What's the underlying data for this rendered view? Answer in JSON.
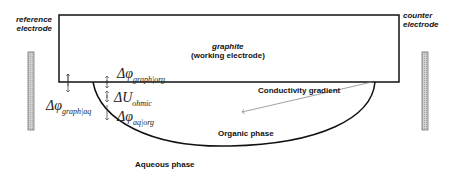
{
  "labels": {
    "reference_electrode": [
      "reference",
      "electrode"
    ],
    "counter_electrode": [
      "counter",
      "electrode"
    ],
    "graphite": "graphite",
    "working_electrode": "(working electrode)",
    "conductivity_gradient": "Conductivity gradient",
    "organic_phase": "Organic phase",
    "aqueous_phase": "Aqueous phase"
  },
  "potentials": {
    "graph_org": {
      "symbol": "Δφ",
      "sub": "graph|org"
    },
    "graph_aq": {
      "symbol": "Δφ",
      "sub": "graph|aq"
    },
    "ohmic": {
      "symbol": "ΔU",
      "sub": "ohmic"
    },
    "aq_org": {
      "symbol": "Δφ",
      "sub": "aq|org"
    }
  },
  "colors": {
    "line": "#111111",
    "electrode_fill": "#c8c8c8",
    "arrow_gray": "#888888"
  }
}
